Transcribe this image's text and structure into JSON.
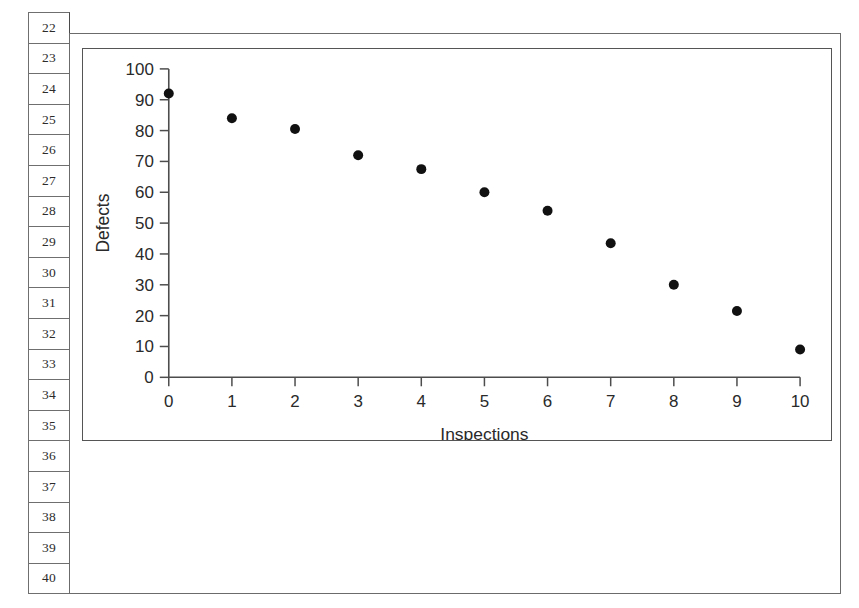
{
  "window": {
    "kind": "spreadsheet-with-embedded-chart",
    "background_color": "#ffffff",
    "frame_color": "#6b6b6b"
  },
  "row_headers": {
    "name": "spreadsheet-row-numbers",
    "labels": [
      "22",
      "23",
      "24",
      "25",
      "26",
      "27",
      "28",
      "29",
      "30",
      "31",
      "32",
      "33",
      "34",
      "35",
      "36",
      "37",
      "38",
      "39",
      "40"
    ]
  },
  "chart_data": {
    "type": "scatter",
    "title": "",
    "xlabel": "Inspections",
    "ylabel": "Defects",
    "xlim": [
      0,
      10
    ],
    "ylim": [
      0,
      100
    ],
    "xticks": [
      0,
      1,
      2,
      3,
      4,
      5,
      6,
      7,
      8,
      9,
      10
    ],
    "xtick_labels": [
      "0",
      "1",
      "2",
      "3",
      "4",
      "5",
      "6",
      "7",
      "8",
      "9",
      "10"
    ],
    "yticks": [
      0,
      10,
      20,
      30,
      40,
      50,
      60,
      70,
      80,
      90,
      100
    ],
    "ytick_labels": [
      "0",
      "10",
      "20",
      "30",
      "40",
      "50",
      "60",
      "70",
      "80",
      "90",
      "100"
    ],
    "grid": false,
    "legend": false,
    "marker": "filled-circle",
    "marker_color": "#111111",
    "marker_size": 5,
    "x": [
      0,
      1,
      2,
      3,
      4,
      5,
      6,
      7,
      8,
      9,
      10
    ],
    "values": [
      92,
      84,
      80.5,
      72,
      67.5,
      60,
      54,
      43.5,
      30,
      21.5,
      9
    ],
    "series": [
      {
        "name": "Defects per inspection",
        "x": [
          0,
          1,
          2,
          3,
          4,
          5,
          6,
          7,
          8,
          9,
          10
        ],
        "values": [
          92,
          84,
          80.5,
          72,
          67.5,
          60,
          54,
          43.5,
          30,
          21.5,
          9
        ]
      }
    ]
  }
}
